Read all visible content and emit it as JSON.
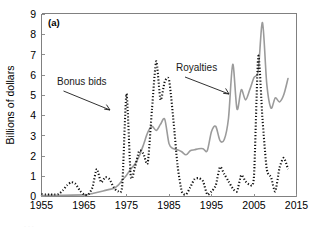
{
  "figure": {
    "panel_label": "(a)",
    "ylabel": "Billions of dollars",
    "xlabel": ""
  },
  "annotations": {
    "bonus": "Bonus bids",
    "royalties": "Royalties"
  },
  "colors": {
    "royalties_line": "#9b9b9b",
    "bonus_line": "#111111",
    "axis": "#808080",
    "text": "#000000",
    "background": "#ffffff"
  },
  "chart_data": {
    "type": "line",
    "title": "",
    "subtitle": "",
    "panel": "(a)",
    "xlabel": "",
    "ylabel": "Billions of dollars",
    "xlim": [
      1955,
      2015
    ],
    "ylim": [
      0,
      9
    ],
    "xticks": [
      1955,
      1965,
      1975,
      1985,
      1995,
      2005,
      2015
    ],
    "yticks": [
      0,
      1,
      2,
      3,
      4,
      5,
      6,
      7,
      8,
      9
    ],
    "ytick_labels": [
      "0",
      "1",
      "2",
      "3",
      "4",
      "5",
      "6",
      "7",
      "8",
      "9"
    ],
    "xtick_labels": [
      "1955",
      "1965",
      "1975",
      "1985",
      "1995",
      "2005",
      "2015"
    ],
    "grid": false,
    "legend": "annotations-with-arrows",
    "legend_position": "in-plot",
    "series": [
      {
        "name": "Bonus bids",
        "style": "dotted",
        "color": "#111111",
        "x": [
          1955,
          1956,
          1957,
          1958,
          1959,
          1960,
          1961,
          1962,
          1963,
          1964,
          1965,
          1966,
          1967,
          1968,
          1969,
          1970,
          1971,
          1972,
          1973,
          1974,
          1975,
          1976,
          1977,
          1978,
          1979,
          1980,
          1981,
          1982,
          1983,
          1984,
          1985,
          1986,
          1987,
          1988,
          1989,
          1990,
          1991,
          1992,
          1993,
          1994,
          1995,
          1996,
          1997,
          1998,
          1999,
          2000,
          2001,
          2002,
          2003,
          2004,
          2005,
          2006,
          2007,
          2008,
          2009,
          2010,
          2011,
          2012,
          2013
        ],
        "values": [
          0.12,
          0.1,
          0.1,
          0.1,
          0.12,
          0.3,
          0.55,
          0.7,
          0.62,
          0.3,
          0.1,
          0.1,
          0.45,
          1.35,
          0.7,
          0.95,
          0.85,
          0.45,
          0.25,
          0.55,
          5.05,
          1.0,
          1.45,
          2.25,
          2.1,
          1.65,
          4.3,
          6.65,
          4.75,
          5.65,
          5.75,
          3.85,
          1.55,
          0.25,
          0.1,
          0.45,
          0.85,
          0.9,
          0.75,
          0.1,
          0.25,
          0.55,
          1.45,
          1.1,
          0.75,
          0.4,
          0.25,
          1.05,
          0.75,
          0.6,
          1.0,
          6.9,
          3.8,
          1.35,
          0.95,
          0.25,
          1.4,
          1.9,
          1.35
        ],
        "units": "billions of dollars"
      },
      {
        "name": "Royalties",
        "style": "solid",
        "color": "#9b9b9b",
        "x": [
          1955,
          1960,
          1965,
          1966,
          1967,
          1968,
          1969,
          1970,
          1971,
          1972,
          1973,
          1974,
          1975,
          1976,
          1977,
          1978,
          1979,
          1980,
          1981,
          1982,
          1983,
          1984,
          1985,
          1986,
          1987,
          1988,
          1989,
          1990,
          1991,
          1992,
          1993,
          1994,
          1995,
          1996,
          1997,
          1998,
          1999,
          2000,
          2001,
          2002,
          2003,
          2004,
          2005,
          2006,
          2007,
          2008,
          2009,
          2010,
          2011,
          2012,
          2013
        ],
        "values": [
          0.05,
          0.06,
          0.08,
          0.1,
          0.15,
          0.2,
          0.25,
          0.3,
          0.35,
          0.4,
          0.55,
          0.8,
          1.05,
          1.35,
          1.6,
          2.0,
          2.55,
          3.15,
          3.45,
          3.25,
          3.55,
          3.8,
          2.6,
          2.35,
          2.3,
          2.2,
          2.05,
          2.25,
          2.3,
          2.35,
          2.35,
          2.25,
          3.2,
          3.45,
          2.75,
          2.8,
          3.85,
          6.5,
          4.3,
          5.25,
          4.75,
          5.25,
          5.85,
          6.2,
          8.55,
          5.55,
          4.35,
          4.85,
          4.65,
          5.0,
          5.8
        ],
        "units": "billions of dollars"
      }
    ]
  }
}
